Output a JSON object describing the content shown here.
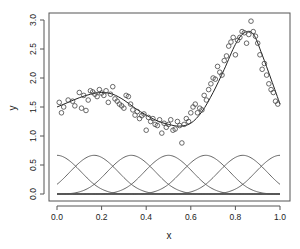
{
  "chart_data": {
    "type": "scatter",
    "title": "",
    "xlabel": "x",
    "ylabel": "y",
    "xlim": [
      0,
      1
    ],
    "ylim": [
      0,
      3
    ],
    "xticks": [
      "0.0",
      "0.2",
      "0.4",
      "0.6",
      "0.8",
      "1.0"
    ],
    "yticks": [
      "0.0",
      "0.5",
      "1.0",
      "1.5",
      "2.0",
      "2.5",
      "3.0"
    ],
    "grid": false,
    "legend": null,
    "series": [
      {
        "name": "observations",
        "kind": "points",
        "marker": "open-circle",
        "x": [
          0.01,
          0.02,
          0.03,
          0.05,
          0.07,
          0.08,
          0.1,
          0.11,
          0.12,
          0.13,
          0.14,
          0.15,
          0.16,
          0.17,
          0.18,
          0.19,
          0.2,
          0.21,
          0.22,
          0.23,
          0.24,
          0.25,
          0.26,
          0.27,
          0.28,
          0.29,
          0.3,
          0.31,
          0.32,
          0.33,
          0.34,
          0.35,
          0.36,
          0.37,
          0.38,
          0.39,
          0.4,
          0.41,
          0.42,
          0.43,
          0.44,
          0.45,
          0.46,
          0.47,
          0.48,
          0.49,
          0.5,
          0.51,
          0.52,
          0.53,
          0.54,
          0.55,
          0.56,
          0.57,
          0.58,
          0.59,
          0.6,
          0.61,
          0.62,
          0.63,
          0.64,
          0.65,
          0.66,
          0.67,
          0.68,
          0.69,
          0.7,
          0.71,
          0.72,
          0.73,
          0.74,
          0.75,
          0.76,
          0.77,
          0.78,
          0.79,
          0.8,
          0.81,
          0.82,
          0.83,
          0.84,
          0.85,
          0.86,
          0.87,
          0.88,
          0.89,
          0.9,
          0.91,
          0.92,
          0.93,
          0.94,
          0.95,
          0.96,
          0.97,
          0.98,
          0.99
        ],
        "y": [
          1.58,
          1.4,
          1.5,
          1.62,
          1.6,
          1.52,
          1.75,
          1.48,
          1.7,
          1.44,
          1.62,
          1.78,
          1.76,
          1.72,
          1.68,
          1.8,
          1.74,
          1.7,
          1.78,
          1.58,
          1.72,
          1.85,
          1.64,
          1.6,
          1.55,
          1.52,
          1.48,
          1.7,
          1.68,
          1.55,
          1.45,
          1.36,
          1.42,
          1.3,
          1.35,
          1.38,
          1.1,
          1.32,
          1.25,
          1.3,
          1.2,
          1.18,
          1.28,
          1.05,
          1.22,
          1.15,
          1.2,
          1.28,
          1.1,
          1.12,
          1.25,
          1.18,
          0.88,
          1.2,
          1.3,
          1.25,
          1.4,
          1.5,
          1.55,
          1.4,
          1.48,
          1.45,
          1.7,
          1.62,
          1.8,
          1.9,
          2.0,
          1.98,
          2.2,
          2.1,
          2.05,
          2.3,
          2.38,
          2.55,
          2.62,
          2.7,
          2.4,
          2.65,
          2.7,
          2.8,
          2.78,
          2.6,
          2.75,
          2.98,
          2.8,
          2.72,
          2.6,
          2.4,
          2.15,
          2.25,
          2.05,
          1.9,
          1.8,
          1.75,
          1.6,
          1.55
        ]
      },
      {
        "name": "fitted-spline",
        "kind": "line",
        "x": [
          0.0,
          0.05,
          0.1,
          0.15,
          0.2,
          0.25,
          0.3,
          0.35,
          0.4,
          0.45,
          0.5,
          0.55,
          0.6,
          0.65,
          0.7,
          0.75,
          0.8,
          0.84,
          0.88,
          0.92,
          0.96,
          1.0
        ],
        "y": [
          1.5,
          1.58,
          1.66,
          1.72,
          1.75,
          1.72,
          1.62,
          1.48,
          1.36,
          1.26,
          1.2,
          1.17,
          1.22,
          1.42,
          1.75,
          2.15,
          2.58,
          2.78,
          2.76,
          2.4,
          1.98,
          1.55
        ]
      }
    ],
    "basis_functions": {
      "count": 7,
      "peak_height": 0.667,
      "knot_spacing": 0.1667,
      "centers": [
        0.0,
        0.1667,
        0.3333,
        0.5,
        0.6667,
        0.8333,
        1.0
      ]
    }
  },
  "axes": {
    "xlabel": "x",
    "ylabel": "y"
  }
}
